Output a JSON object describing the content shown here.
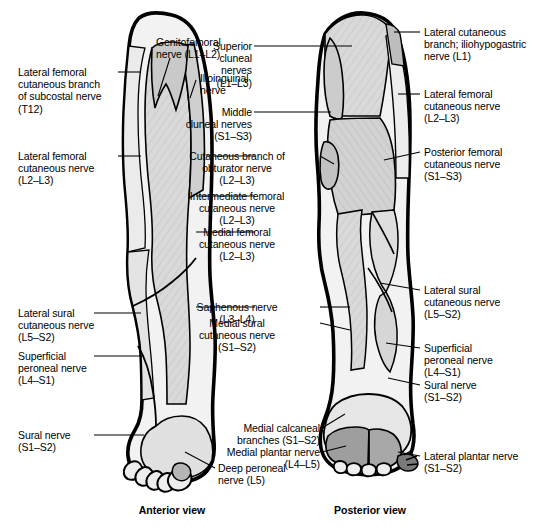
{
  "figure": {
    "views": [
      {
        "name": "anterior-view",
        "caption": "Anterior view"
      },
      {
        "name": "posterior-view",
        "caption": "Posterior view"
      }
    ],
    "colors": {
      "outline": "#000000",
      "skin_unshaded": "#f2f2f2",
      "territory_light": "#d9d9d9",
      "territory_mid": "#c9c9c9",
      "territory_dark": "#a8a8a8",
      "background": "#ffffff",
      "leader_line": "#000000",
      "text": "#000000"
    }
  },
  "labels": {
    "left_column": [
      {
        "id": "lateral-femoral-cutaneous-branch-subcostal",
        "lines": [
          "Lateral femoral",
          "cutaneous branch",
          "of subcostal nerve",
          "(T12)"
        ],
        "roots": "T12"
      },
      {
        "id": "lateral-femoral-cutaneous-nerve-anterior",
        "lines": [
          "Lateral femoral",
          "cutaneous nerve",
          "(L2–L3)"
        ],
        "roots": "L2–L3"
      },
      {
        "id": "lateral-sural-cutaneous-nerve-anterior",
        "lines": [
          "Lateral sural",
          "cutaneous nerve",
          "(L5–S2)"
        ],
        "roots": "L5–S2"
      },
      {
        "id": "superficial-peroneal-nerve-anterior",
        "lines": [
          "Superficial",
          "peroneal nerve",
          "(L4–S1)"
        ],
        "roots": "L4–S1"
      },
      {
        "id": "sural-nerve-anterior",
        "lines": [
          "Sural nerve",
          "(S1–S2)"
        ],
        "roots": "S1–S2"
      }
    ],
    "center_column": [
      {
        "id": "genitofemoral-nerve",
        "lines": [
          "Genitofemoral",
          "nerve (L1–L2)"
        ],
        "roots": "L1–L2"
      },
      {
        "id": "ilioinguinal-nerve",
        "lines": [
          "Ilioinguinal",
          "nerve"
        ],
        "roots": ""
      },
      {
        "id": "superior-cluneal-nerves",
        "lines": [
          "Superior",
          "cluneal",
          "nerves",
          "(L1–L3)"
        ],
        "roots": "L1–L3"
      },
      {
        "id": "middle-cluneal-nerves",
        "lines": [
          "Middle",
          "cluneal nerves",
          "(S1–S3)"
        ],
        "roots": "S1–S3"
      },
      {
        "id": "cutaneous-branch-obturator-nerve",
        "lines": [
          "Cutaneous branch of",
          "obturator nerve",
          "(L2–L3)"
        ],
        "roots": "L2–L3"
      },
      {
        "id": "intermediate-femoral-cutaneous-nerve",
        "lines": [
          "Intermediate femoral",
          "cutaneous nerve",
          "(L2–L3)"
        ],
        "roots": "L2–L3"
      },
      {
        "id": "medial-femoral-cutaneous-nerve",
        "lines": [
          "Medial femoral",
          "cutaneous nerve",
          "(L2–L3)"
        ],
        "roots": "L2–L3"
      },
      {
        "id": "saphenous-nerve",
        "lines": [
          "Saphenous nerve",
          "(L3–L4)"
        ],
        "roots": "L3–L4"
      },
      {
        "id": "medial-sural-cutaneous-nerve",
        "lines": [
          "Medial sural",
          "cutaneous nerve",
          "(S1–S2)"
        ],
        "roots": "S1–S2"
      },
      {
        "id": "medial-calcaneal-branches",
        "lines": [
          "Medial calcaneal",
          "branches (S1–S2)"
        ],
        "roots": "S1–S2"
      },
      {
        "id": "medial-plantar-nerve",
        "lines": [
          "Medial plantar nerve",
          "(L4–L5)"
        ],
        "roots": "L4–L5"
      },
      {
        "id": "deep-peroneal-nerve",
        "lines": [
          "Deep peroneal",
          "nerve (L5)"
        ],
        "roots": "L5"
      }
    ],
    "right_column": [
      {
        "id": "lateral-cutaneous-branch-iliohypogastric",
        "lines": [
          "Lateral cutaneous",
          "branch; iliohypogastric",
          "nerve (L1)"
        ],
        "roots": "L1"
      },
      {
        "id": "lateral-femoral-cutaneous-nerve-posterior",
        "lines": [
          "Lateral femoral",
          "cutaneous nerve",
          "(L2–L3)"
        ],
        "roots": "L2–L3"
      },
      {
        "id": "posterior-femoral-cutaneous-nerve",
        "lines": [
          "Posterior femoral",
          "cutaneous nerve",
          "(S1–S3)"
        ],
        "roots": "S1–S3"
      },
      {
        "id": "lateral-sural-cutaneous-nerve-posterior",
        "lines": [
          "Lateral sural",
          "cutaneous nerve",
          "(L5–S2)"
        ],
        "roots": "L5–S2"
      },
      {
        "id": "superficial-peroneal-nerve-posterior",
        "lines": [
          "Superficial",
          "peroneal nerve",
          "(L4–S1)"
        ],
        "roots": "L4–S1"
      },
      {
        "id": "sural-nerve-posterior",
        "lines": [
          "Sural nerve",
          "(S1–S2)"
        ],
        "roots": "S1–S2"
      },
      {
        "id": "lateral-plantar-nerve",
        "lines": [
          "Lateral plantar nerve",
          "(S1–S2)"
        ],
        "roots": "S1–S2"
      }
    ]
  },
  "text": {
    "L0": "Lateral femoral\ncutaneous branch\nof subcostal nerve\n(T12)",
    "L1": "Lateral femoral\ncutaneous nerve\n(L2–L3)",
    "L2": "Lateral sural\ncutaneous nerve\n(L5–S2)",
    "L3": "Superficial\nperoneal nerve\n(L4–S1)",
    "L4": "Sural nerve\n(S1–S2)",
    "C0": "Genitofemoral\nnerve (L1–L2)",
    "C1": "Ilioinguinal\nnerve",
    "C2": "Superior\ncluneal\nnerves\n(L1–L3)",
    "C3": "Middle\ncluneal nerves\n(S1–S3)",
    "C4": "Cutaneous branch of\nobturator nerve\n(L2–L3)",
    "C5": "Intermediate femoral\ncutaneous nerve\n(L2–L3)",
    "C6": "Medial femoral\ncutaneous nerve\n(L2–L3)",
    "C7": "Saphenous nerve\n(L3–L4)",
    "C8": "Medial sural\ncutaneous nerve\n(S1–S2)",
    "C9": "Medial calcaneal\nbranches (S1–S2)",
    "C10": "Medial plantar nerve\n(L4–L5)",
    "C11": "Deep peroneal\nnerve (L5)",
    "R0": "Lateral cutaneous\nbranch; iliohypogastric\nnerve (L1)",
    "R1": "Lateral femoral\ncutaneous nerve\n(L2–L3)",
    "R2": "Posterior femoral\ncutaneous nerve\n(S1–S3)",
    "R3": "Lateral sural\ncutaneous nerve\n(L5–S2)",
    "R4": "Superficial\nperoneal nerve\n(L4–S1)",
    "R5": "Sural nerve\n(S1–S2)",
    "R6": "Lateral plantar nerve\n(S1–S2)",
    "CAP_A": "Anterior view",
    "CAP_P": "Posterior view"
  }
}
